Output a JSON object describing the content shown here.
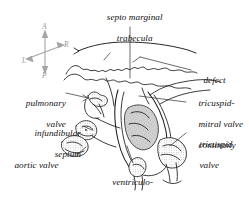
{
  "figure": {
    "width": 249,
    "height": 197,
    "background_color": "#ffffff",
    "ink_color": "#111111",
    "shading_color": "#9a9a9a"
  },
  "orientation_compass": {
    "name": "orientation-compass",
    "color": "#9a9a9a",
    "anterior": "A",
    "posterior": "P",
    "right": "R",
    "left": "L"
  },
  "labels": {
    "septo_marginal_trabecula": {
      "line1": "septo marginal",
      "line2": "trabecula"
    },
    "defect": "defect",
    "tricuspid_mitral_valve_continuity": {
      "line1": "tricuspid-",
      "line2": "mitral valve",
      "line3": "continuity"
    },
    "tricuspid_valve": {
      "line1": "tricuspid",
      "line2": "valve"
    },
    "ventriculo_infundibular_fold": {
      "line1": "ventriculo-",
      "line2": "infundibular fold"
    },
    "aortic_valve": "aortic valve",
    "infundibular_septum": {
      "line1": "infundibular",
      "line2": "septum"
    },
    "pulmonary_valve": {
      "line1": "pulmonary",
      "line2": "valve"
    }
  }
}
